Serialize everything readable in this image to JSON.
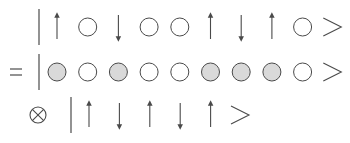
{
  "diagram": {
    "colors": {
      "stroke": "#4a4a4a",
      "filled": "#d9d9d9",
      "empty": "#ffffff"
    },
    "rows": [
      {
        "id": "row-1",
        "prefix": "",
        "symbols": [
          "up",
          "circle-empty",
          "down",
          "circle-empty",
          "circle-empty",
          "up",
          "down",
          "up",
          "circle-empty",
          "greater-than"
        ]
      },
      {
        "id": "row-2",
        "prefix": "equals",
        "symbols": [
          "circle-filled",
          "circle-empty",
          "circle-filled",
          "circle-empty",
          "circle-empty",
          "circle-filled",
          "circle-filled",
          "circle-filled",
          "circle-empty",
          "greater-than"
        ]
      },
      {
        "id": "row-3",
        "prefix": "otimes",
        "symbols": [
          "up",
          "down",
          "up",
          "down",
          "up",
          "greater-than"
        ]
      }
    ]
  }
}
